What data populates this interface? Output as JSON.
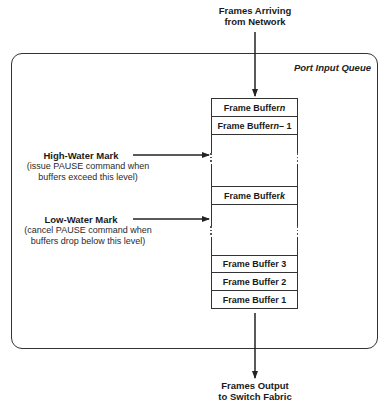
{
  "diagram": {
    "input_label": [
      "Frames Arriving",
      "from Network"
    ],
    "output_label": [
      "Frames Output",
      "to Switch Fabric"
    ],
    "queue_title": "Port Input Queue",
    "buffers": [
      {
        "prefix": "Frame Buffer ",
        "var": "n",
        "suffix": ""
      },
      {
        "prefix": "Frame Buffer ",
        "var": "n",
        "suffix": " – 1"
      },
      {
        "prefix": "Frame Buffer ",
        "var": "k",
        "suffix": ""
      },
      {
        "prefix": "Frame Buffer 3",
        "var": "",
        "suffix": ""
      },
      {
        "prefix": "Frame Buffer 2",
        "var": "",
        "suffix": ""
      },
      {
        "prefix": "Frame Buffer 1",
        "var": "",
        "suffix": ""
      }
    ],
    "high_water": {
      "title": "High-Water Mark",
      "desc": [
        "(issue PAUSE command when",
        "buffers exceed this level)"
      ]
    },
    "low_water": {
      "title": "Low-Water Mark",
      "desc": [
        "(cancel PAUSE command when",
        "buffers drop below this level)"
      ]
    },
    "line_color": "#333333"
  }
}
